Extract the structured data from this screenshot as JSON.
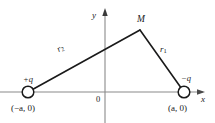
{
  "figure": {
    "type": "physics-diagram",
    "width": 215,
    "height": 123,
    "background_color": "#ffffff",
    "line_color": "#1a1a1a",
    "axis_color": "#8a8a8a"
  },
  "axes": {
    "x_label": "x",
    "y_label": "y",
    "origin_label": "0",
    "x_axis": {
      "x1": 0,
      "y1": 92,
      "x2": 205,
      "y2": 92,
      "arrow": "right"
    },
    "y_axis": {
      "x1": 105,
      "y1": 123,
      "x2": 105,
      "y2": 9,
      "arrow": "up"
    }
  },
  "charges": [
    {
      "name": "positive-charge",
      "label": "+q",
      "coordinate_label": "(−a, 0)",
      "cx": 28,
      "cy": 92,
      "r": 6
    },
    {
      "name": "negative-charge",
      "label": "−q",
      "coordinate_label": "(a, 0)",
      "cx": 184,
      "cy": 92,
      "r": 6
    }
  ],
  "field_point": {
    "label": "M",
    "x": 140,
    "y": 30
  },
  "distances": [
    {
      "name": "r-one",
      "label": "r",
      "subscript": "1",
      "from": "field-point-M",
      "to": "negative-charge",
      "x1": 140,
      "y1": 30,
      "x2": 184,
      "y2": 92
    },
    {
      "name": "r-two",
      "label": "r",
      "subscript": "2",
      "from": "positive-charge",
      "to": "field-point-M",
      "x1": 28,
      "y1": 92,
      "x2": 140,
      "y2": 30
    }
  ]
}
